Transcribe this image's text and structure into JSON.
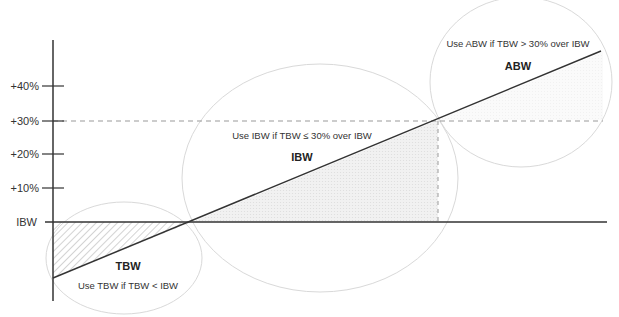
{
  "diagram": {
    "title_fragment": "",
    "y_axis": {
      "ticks": [
        {
          "label": "+40%",
          "y": 86
        },
        {
          "label": "+30%",
          "y": 121
        },
        {
          "label": "+20%",
          "y": 154
        },
        {
          "label": "+10%",
          "y": 188
        },
        {
          "label": "IBW",
          "y": 222
        }
      ]
    },
    "regions": [
      {
        "id": "tbw",
        "title": "TBW",
        "rule": "Use TBW if TBW < IBW"
      },
      {
        "id": "ibw",
        "title": "IBW",
        "rule": "Use IBW if TBW ≤ 30% over IBW"
      },
      {
        "id": "abw",
        "title": "ABW",
        "rule": "Use ABW if TBW > 30% over IBW"
      }
    ],
    "colors": {
      "axis": "#333333",
      "line": "#333333",
      "ellipse": "#d9d9d9",
      "dashed": "#999999",
      "fill_light": "#ececec",
      "hatch": "#b5b5b5"
    }
  }
}
